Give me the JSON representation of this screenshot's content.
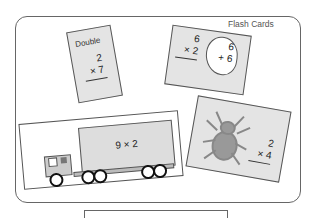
{
  "title": "Flash Cards",
  "cards": [
    {
      "label": "Double",
      "top": "2",
      "bottom": "× 7"
    },
    {
      "top": "6",
      "bottom": "× 2",
      "bubble_top": "6",
      "bubble_bottom": "+ 6"
    },
    {
      "image": "spider-icon",
      "top": "2",
      "bottom": "× 4"
    },
    {
      "image": "truck-icon",
      "text": "9 × 2"
    }
  ],
  "answer_box": ""
}
